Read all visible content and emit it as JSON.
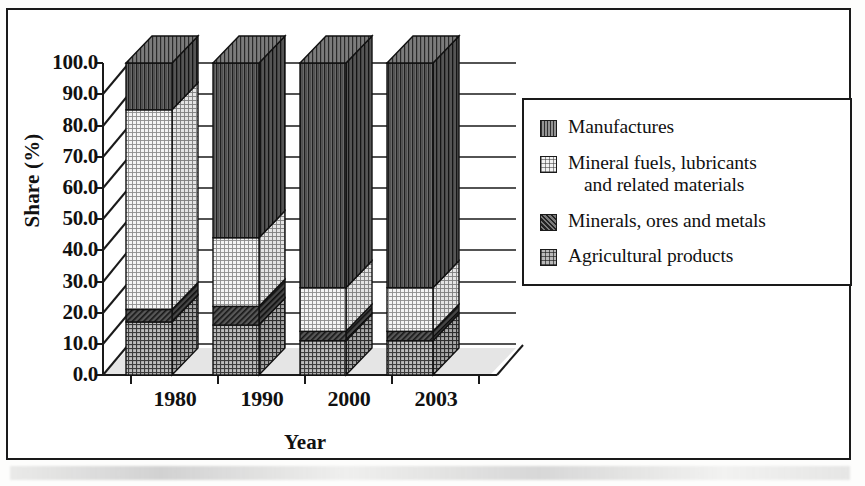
{
  "chart_data": {
    "type": "bar",
    "subtype": "stacked-100-3d",
    "title": "",
    "xlabel": "Year",
    "ylabel": "Share (%)",
    "categories": [
      "1980",
      "1990",
      "2000",
      "2003"
    ],
    "ylim": [
      0.0,
      100.0
    ],
    "ytick_labels": [
      "100.0",
      "90.0",
      "80.0",
      "70.0",
      "60.0",
      "50.0",
      "40.0",
      "30.0",
      "20.0",
      "10.0",
      "0.0"
    ],
    "ytick_values": [
      100.0,
      90.0,
      80.0,
      70.0,
      60.0,
      50.0,
      40.0,
      30.0,
      20.0,
      10.0,
      0.0
    ],
    "grid": true,
    "legend_position": "right",
    "stack_order_bottom_to_top": [
      "Agricultural products",
      "Minerals, ores and metals",
      "Mineral fuels, lubricants and related materials",
      "Manufactures"
    ],
    "series": [
      {
        "name": "Agricultural products",
        "pattern": "pat-agri",
        "values": [
          17.0,
          16.0,
          11.0,
          11.0
        ]
      },
      {
        "name": "Minerals, ores and metals",
        "pattern": "pat-minerals",
        "values": [
          4.0,
          6.0,
          3.0,
          3.0
        ]
      },
      {
        "name": "Mineral fuels, lubricants and related materials",
        "pattern": "pat-fuels",
        "values": [
          64.0,
          22.0,
          14.0,
          14.0
        ]
      },
      {
        "name": "Manufactures",
        "pattern": "pat-manufactures",
        "values": [
          15.0,
          56.0,
          72.0,
          72.0
        ]
      }
    ]
  },
  "legend": {
    "items": [
      {
        "label": "Manufactures",
        "label_cont": "",
        "pattern": "pat-manufactures"
      },
      {
        "label": "Mineral fuels, lubricants",
        "label_cont": "and related materials",
        "pattern": "pat-fuels"
      },
      {
        "label": "Minerals, ores and metals",
        "label_cont": "",
        "pattern": "pat-minerals"
      },
      {
        "label": "Agricultural products",
        "label_cont": "",
        "pattern": "pat-agri"
      }
    ]
  }
}
